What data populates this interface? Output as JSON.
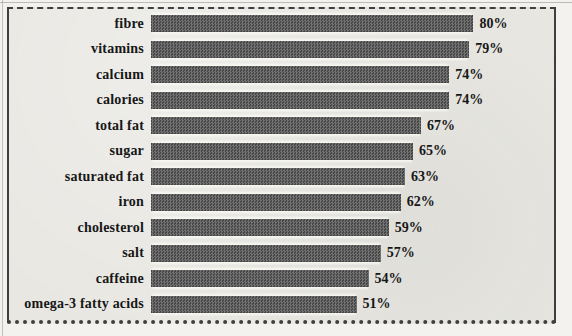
{
  "chart_data": {
    "type": "bar",
    "orientation": "horizontal",
    "title": "",
    "xlabel": "",
    "ylabel": "",
    "categories": [
      "fibre",
      "vitamins",
      "calcium",
      "calories",
      "total fat",
      "sugar",
      "saturated fat",
      "iron",
      "cholesterol",
      "salt",
      "caffeine",
      "omega-3 fatty acids"
    ],
    "values": [
      80,
      79,
      74,
      74,
      67,
      65,
      63,
      62,
      59,
      57,
      54,
      51
    ],
    "value_labels": [
      "80%",
      "79%",
      "74%",
      "74%",
      "67%",
      "65%",
      "63%",
      "62%",
      "59%",
      "57%",
      "54%",
      "51%"
    ],
    "xlim": [
      0,
      100
    ],
    "grid": false,
    "legend": false,
    "bar_texture": "checker-halftone",
    "colors": {
      "bar": "#5b5b5b",
      "background": "#e8e7e2",
      "border": "#3f3f3f",
      "text": "#171717"
    }
  }
}
